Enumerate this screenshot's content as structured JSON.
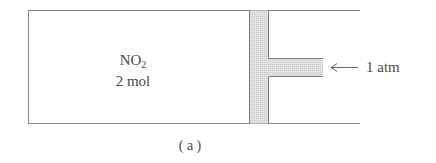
{
  "diagram": {
    "gas_formula": "NO",
    "gas_subscript": "2",
    "amount": "2 mol",
    "pressure_label": "1 atm",
    "caption": "( a )",
    "colors": {
      "line": "#8a8a8a",
      "piston_fill": "#dcdcdc",
      "text": "#4a4a4a"
    }
  }
}
